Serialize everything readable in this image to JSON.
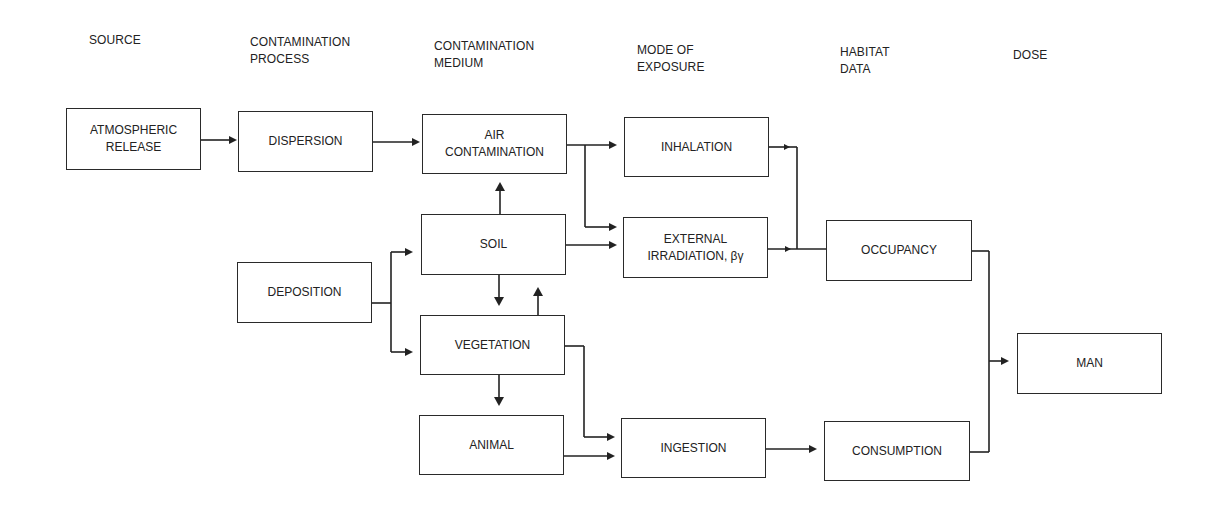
{
  "diagram": {
    "type": "flowchart",
    "columns": [
      {
        "id": "source",
        "label": "SOURCE",
        "x": 89,
        "y": 32
      },
      {
        "id": "process",
        "label": "CONTAMINATION\nPROCESS",
        "x": 250,
        "y": 34
      },
      {
        "id": "medium",
        "label": "CONTAMINATION\nMEDIUM",
        "x": 434,
        "y": 38
      },
      {
        "id": "exposure",
        "label": "MODE OF\nEXPOSURE",
        "x": 637,
        "y": 42
      },
      {
        "id": "habitat",
        "label": "HABITAT\nDATA",
        "x": 840,
        "y": 44
      },
      {
        "id": "dose",
        "label": "DOSE",
        "x": 1013,
        "y": 47
      }
    ],
    "nodes": [
      {
        "id": "atmospheric_release",
        "label": "ATMOSPHERIC\nRELEASE",
        "column": "source",
        "x": 66,
        "y": 108,
        "w": 135,
        "h": 62
      },
      {
        "id": "dispersion",
        "label": "DISPERSION",
        "column": "process",
        "x": 238,
        "y": 111,
        "w": 135,
        "h": 61
      },
      {
        "id": "deposition",
        "label": "DEPOSITION",
        "column": "process",
        "x": 237,
        "y": 262,
        "w": 135,
        "h": 61
      },
      {
        "id": "air_contamination",
        "label": "AIR\nCONTAMINATION",
        "column": "medium",
        "x": 422,
        "y": 114,
        "w": 145,
        "h": 60
      },
      {
        "id": "soil",
        "label": "SOIL",
        "column": "medium",
        "x": 421,
        "y": 214,
        "w": 145,
        "h": 61
      },
      {
        "id": "vegetation",
        "label": "VEGETATION",
        "column": "medium",
        "x": 420,
        "y": 315,
        "w": 145,
        "h": 60
      },
      {
        "id": "animal",
        "label": "ANIMAL",
        "column": "medium",
        "x": 419,
        "y": 415,
        "w": 145,
        "h": 60
      },
      {
        "id": "inhalation",
        "label": "INHALATION",
        "column": "exposure",
        "x": 624,
        "y": 117,
        "w": 145,
        "h": 60
      },
      {
        "id": "external_irradiation",
        "label": "EXTERNAL\nIRRADIATION, βγ",
        "column": "exposure",
        "x": 623,
        "y": 217,
        "w": 145,
        "h": 61
      },
      {
        "id": "ingestion",
        "label": "INGESTION",
        "column": "exposure",
        "x": 621,
        "y": 418,
        "w": 145,
        "h": 60
      },
      {
        "id": "occupancy",
        "label": "OCCUPANCY",
        "column": "habitat",
        "x": 826,
        "y": 220,
        "w": 146,
        "h": 61
      },
      {
        "id": "consumption",
        "label": "CONSUMPTION",
        "column": "habitat",
        "x": 824,
        "y": 421,
        "w": 146,
        "h": 60
      },
      {
        "id": "man",
        "label": "MAN",
        "column": "dose",
        "x": 1017,
        "y": 333,
        "w": 145,
        "h": 61
      }
    ],
    "edges": [
      {
        "from": "atmospheric_release",
        "to": "dispersion"
      },
      {
        "from": "dispersion",
        "to": "air_contamination"
      },
      {
        "from": "deposition",
        "to": "soil"
      },
      {
        "from": "deposition",
        "to": "vegetation"
      },
      {
        "from": "soil",
        "to": "air_contamination"
      },
      {
        "from": "soil",
        "to": "vegetation"
      },
      {
        "from": "vegetation",
        "to": "soil"
      },
      {
        "from": "vegetation",
        "to": "animal"
      },
      {
        "from": "air_contamination",
        "to": "inhalation"
      },
      {
        "from": "air_contamination",
        "to": "external_irradiation"
      },
      {
        "from": "soil",
        "to": "external_irradiation"
      },
      {
        "from": "vegetation",
        "to": "ingestion"
      },
      {
        "from": "animal",
        "to": "ingestion"
      },
      {
        "from": "inhalation",
        "to": "occupancy"
      },
      {
        "from": "external_irradiation",
        "to": "occupancy"
      },
      {
        "from": "ingestion",
        "to": "consumption"
      },
      {
        "from": "occupancy",
        "to": "man"
      },
      {
        "from": "consumption",
        "to": "man"
      }
    ],
    "colors": {
      "line": "#222222",
      "background": "#ffffff",
      "text": "#222222"
    }
  }
}
